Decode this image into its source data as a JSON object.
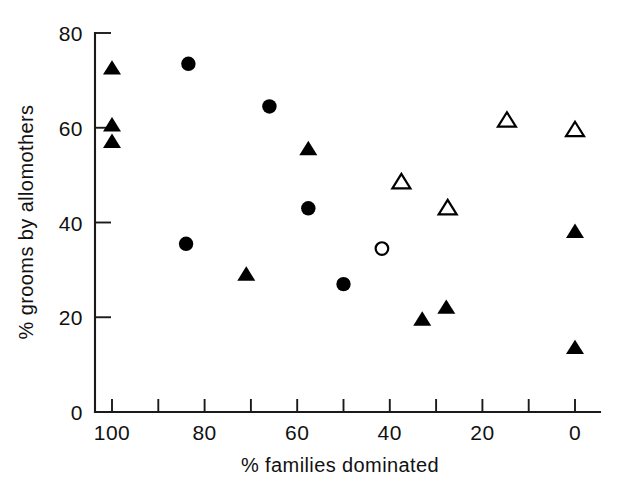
{
  "chart_data": {
    "type": "scatter",
    "title": "",
    "xlabel": "% families dominated",
    "ylabel": "% grooms by allomothers",
    "xlim": [
      100,
      0
    ],
    "ylim": [
      0,
      80
    ],
    "x_axis_reversed": true,
    "grid": false,
    "legend_position": "none",
    "x_ticks": [
      100,
      90,
      80,
      70,
      60,
      50,
      40,
      30,
      20,
      10,
      0
    ],
    "x_tick_labels": [
      "100",
      "",
      "80",
      "",
      "60",
      "",
      "40",
      "",
      "20",
      "",
      "0"
    ],
    "y_ticks": [
      0,
      20,
      40,
      60,
      80
    ],
    "y_tick_labels": [
      "0",
      "20",
      "40",
      "60",
      "80"
    ],
    "series": [
      {
        "name": "filled-triangle",
        "marker": "triangle",
        "fill": "solid",
        "color": "#000000",
        "points": [
          {
            "x": 100,
            "y": 72.5
          },
          {
            "x": 100,
            "y": 60.5
          },
          {
            "x": 100,
            "y": 57.0
          },
          {
            "x": 71.0,
            "y": 29.0
          },
          {
            "x": 57.6,
            "y": 55.5
          },
          {
            "x": 33.0,
            "y": 19.5
          },
          {
            "x": 27.8,
            "y": 22.0
          },
          {
            "x": 0.0,
            "y": 38.0
          },
          {
            "x": 0.0,
            "y": 13.5
          }
        ]
      },
      {
        "name": "filled-circle",
        "marker": "circle",
        "fill": "solid",
        "color": "#000000",
        "points": [
          {
            "x": 83.5,
            "y": 73.5
          },
          {
            "x": 66.0,
            "y": 64.5
          },
          {
            "x": 84.0,
            "y": 35.5
          },
          {
            "x": 57.6,
            "y": 43.0
          },
          {
            "x": 50.0,
            "y": 27.0
          }
        ]
      },
      {
        "name": "open-triangle",
        "marker": "triangle",
        "fill": "open",
        "color": "#000000",
        "points": [
          {
            "x": 37.5,
            "y": 48.5
          },
          {
            "x": 27.5,
            "y": 43.0
          },
          {
            "x": 14.7,
            "y": 61.5
          },
          {
            "x": 0.0,
            "y": 59.5
          }
        ]
      },
      {
        "name": "open-circle",
        "marker": "circle",
        "fill": "open",
        "color": "#000000",
        "points": [
          {
            "x": 41.7,
            "y": 34.5
          }
        ]
      }
    ]
  },
  "axes": {
    "x_title": "% families dominated",
    "y_title": "% grooms by allomothers"
  }
}
